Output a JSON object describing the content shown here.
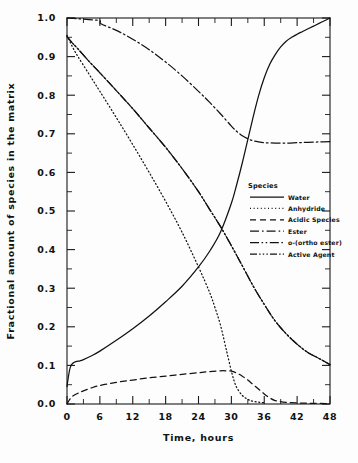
{
  "chart_data": {
    "type": "line",
    "title": "",
    "xlabel": "Time, hours",
    "ylabel": "Fractional amount of species in the matrix",
    "xlim": [
      0,
      48
    ],
    "ylim": [
      0,
      1
    ],
    "grid": false,
    "legend_position": "inside-right",
    "legend_title": "Species",
    "xticks": [
      "0",
      "6",
      "12",
      "18",
      "24",
      "30",
      "36",
      "42",
      "48"
    ],
    "xtick_values": [
      0,
      6,
      12,
      18,
      24,
      30,
      36,
      42,
      48
    ],
    "yticks": [
      "0.0",
      "0.1",
      "0.2",
      "0.3",
      "0.4",
      "0.5",
      "0.6",
      "0.7",
      "0.8",
      "0.9",
      "1.0"
    ],
    "ytick_values": [
      0,
      0.1,
      0.2,
      0.3,
      0.4,
      0.5,
      0.6,
      0.7,
      0.8,
      0.9,
      1.0
    ],
    "y_minor_step": 0.05,
    "x_minor_step": 3,
    "series": [
      {
        "name": "Water",
        "dash": "none",
        "x": [
          0,
          0.3,
          0.6,
          1,
          1.6,
          2.4,
          3,
          4.5,
          6,
          9,
          12,
          15,
          18,
          21,
          24,
          26,
          28,
          30,
          31,
          32,
          33,
          34,
          35,
          36,
          37,
          38,
          39,
          40,
          41,
          42,
          43,
          44,
          45,
          46,
          47,
          48
        ],
        "values": [
          0.045,
          0.075,
          0.095,
          0.105,
          0.11,
          0.112,
          0.115,
          0.125,
          0.137,
          0.165,
          0.195,
          0.228,
          0.265,
          0.305,
          0.355,
          0.395,
          0.445,
          0.52,
          0.57,
          0.625,
          0.685,
          0.745,
          0.8,
          0.845,
          0.88,
          0.905,
          0.925,
          0.94,
          0.95,
          0.958,
          0.965,
          0.972,
          0.979,
          0.986,
          0.993,
          1.0
        ]
      },
      {
        "name": "Anhydride",
        "dash": "dotted",
        "x": [
          0,
          1,
          2,
          4,
          6,
          9,
          12,
          15,
          18,
          21,
          24,
          26,
          27,
          28,
          29,
          29.5,
          30,
          30.5,
          31,
          32,
          33,
          34,
          36
        ],
        "values": [
          0.955,
          0.925,
          0.9,
          0.855,
          0.81,
          0.742,
          0.672,
          0.6,
          0.525,
          0.445,
          0.355,
          0.29,
          0.25,
          0.205,
          0.145,
          0.115,
          0.085,
          0.06,
          0.042,
          0.022,
          0.012,
          0.007,
          0.003
        ]
      },
      {
        "name": "Acidic Species",
        "dash": "dashed",
        "x": [
          0,
          0.5,
          1,
          2,
          3,
          4.5,
          6,
          9,
          12,
          15,
          18,
          21,
          24,
          26,
          28,
          29,
          30,
          31,
          32,
          33,
          34,
          35,
          36,
          37,
          38,
          40,
          44,
          48
        ],
        "values": [
          0.0,
          0.012,
          0.02,
          0.028,
          0.034,
          0.042,
          0.048,
          0.056,
          0.062,
          0.068,
          0.072,
          0.077,
          0.081,
          0.084,
          0.086,
          0.086,
          0.085,
          0.08,
          0.072,
          0.062,
          0.05,
          0.038,
          0.026,
          0.016,
          0.009,
          0.004,
          0.002,
          0.001
        ]
      },
      {
        "name": "Ester",
        "dash": "dashdot",
        "x": [
          0,
          2,
          4,
          6,
          6.2,
          9,
          12,
          15,
          18,
          21,
          24,
          26,
          28,
          30,
          31,
          32,
          33,
          34,
          35,
          36,
          38,
          40,
          42,
          44,
          46,
          48
        ],
        "values": [
          1.0,
          0.998,
          0.996,
          0.993,
          0.985,
          0.968,
          0.945,
          0.918,
          0.886,
          0.85,
          0.81,
          0.782,
          0.752,
          0.72,
          0.706,
          0.695,
          0.687,
          0.682,
          0.679,
          0.677,
          0.676,
          0.676,
          0.677,
          0.678,
          0.679,
          0.68
        ]
      },
      {
        "name": "o-(ortho ester)",
        "dash": "dashdotdot",
        "x": [
          0,
          1,
          2,
          4,
          6,
          9,
          12,
          15,
          18,
          21,
          24,
          26,
          28,
          30,
          32,
          34,
          36,
          38,
          40,
          42,
          44,
          46,
          48
        ],
        "values": [
          0.952,
          0.935,
          0.92,
          0.888,
          0.858,
          0.812,
          0.765,
          0.715,
          0.665,
          0.61,
          0.55,
          0.505,
          0.46,
          0.41,
          0.358,
          0.305,
          0.258,
          0.215,
          0.182,
          0.155,
          0.133,
          0.118,
          0.102
        ]
      },
      {
        "name": "Active Agent",
        "dash": "dashdotdot2",
        "x": [
          0,
          1,
          2,
          4,
          6,
          9,
          12,
          15,
          18,
          21,
          24,
          26,
          28,
          30,
          32,
          34,
          36,
          38,
          40,
          42,
          44,
          46,
          48
        ],
        "values": [
          0.952,
          0.935,
          0.92,
          0.888,
          0.858,
          0.812,
          0.765,
          0.715,
          0.665,
          0.61,
          0.55,
          0.505,
          0.46,
          0.41,
          0.358,
          0.305,
          0.258,
          0.215,
          0.182,
          0.155,
          0.133,
          0.118,
          0.102
        ]
      }
    ]
  },
  "legend": {
    "title": "Species",
    "entries": [
      {
        "label": "Water",
        "dash": "none"
      },
      {
        "label": "Anhydride",
        "dash": "dotted"
      },
      {
        "label": "Acidic Species",
        "dash": "dashed"
      },
      {
        "label": "Ester",
        "dash": "dashdot"
      },
      {
        "label": "o-(ortho ester)",
        "dash": "dashdotdot"
      },
      {
        "label": "Active Agent",
        "dash": "dashdotdot2"
      }
    ]
  },
  "colors": {
    "ink": "#121212",
    "background": "#ffffff"
  }
}
